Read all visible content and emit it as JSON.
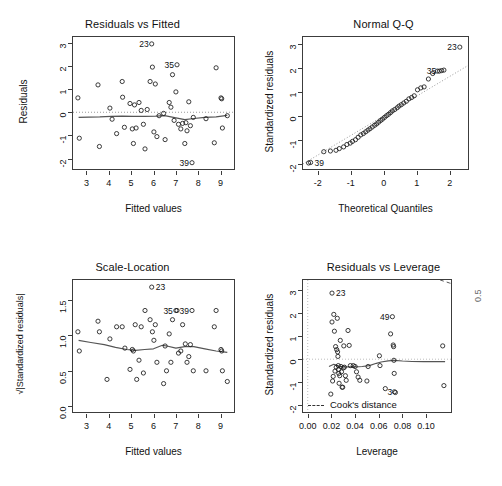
{
  "figure": {
    "kind": "r-regression-diagnostic-panel",
    "layout": "2x2",
    "background_color": "#ffffff",
    "foreground_color": "#1a1a1a",
    "point_symbol": "open-circle"
  },
  "chart_data": [
    {
      "id": "residuals-vs-fitted",
      "type": "scatter",
      "title": "Residuals vs Fitted",
      "xlabel": "Fitted values",
      "ylabel": "Residuals",
      "xlim": [
        2.4,
        9.6
      ],
      "ylim": [
        -2.45,
        3.25
      ],
      "xticks": [
        3,
        4,
        5,
        6,
        7,
        8,
        9
      ],
      "xticklabels": [
        "3",
        "4",
        "5",
        "6",
        "7",
        "8",
        "9"
      ],
      "yticks": [
        -2,
        -1,
        0,
        1,
        2,
        3
      ],
      "yticklabels": [
        "-2",
        "-1",
        "0",
        "1",
        "2",
        "3"
      ],
      "grid": false,
      "legend": "none",
      "reference_line": {
        "type": "horizontal-dotted",
        "y": 0,
        "color": "#9a9a9a"
      },
      "smooth_line": {
        "name": "lowess",
        "color": "#555555",
        "x": [
          2.65,
          3.1,
          3.6,
          4.1,
          4.6,
          5.1,
          5.6,
          6.1,
          6.5,
          7.0,
          7.4,
          7.8,
          8.3,
          8.8,
          9.3
        ],
        "y": [
          -0.22,
          -0.21,
          -0.2,
          -0.18,
          -0.17,
          -0.18,
          -0.18,
          -0.17,
          -0.15,
          -0.24,
          -0.32,
          -0.27,
          -0.22,
          -0.2,
          -0.13
        ]
      },
      "points": {
        "x": [
          2.62,
          2.68,
          3.52,
          3.58,
          4.05,
          4.15,
          4.35,
          4.6,
          4.62,
          4.7,
          4.95,
          5.05,
          5.1,
          5.15,
          5.22,
          5.35,
          5.45,
          5.55,
          5.62,
          5.72,
          5.85,
          5.92,
          5.95,
          6.02,
          6.08,
          6.15,
          6.25,
          6.45,
          6.52,
          6.7,
          6.78,
          6.85,
          6.92,
          7.0,
          7.05,
          7.12,
          7.22,
          7.3,
          7.4,
          7.45,
          7.5,
          7.58,
          7.65,
          7.72,
          7.78,
          8.35,
          8.72,
          8.8,
          9.02,
          9.05,
          9.08,
          9.3
        ],
        "y": [
          0.62,
          -1.12,
          1.18,
          -1.48,
          0.18,
          -0.3,
          -0.92,
          1.33,
          0.65,
          -0.65,
          0.38,
          -0.72,
          -1.35,
          0.32,
          -0.68,
          0.42,
          0.08,
          -0.52,
          -1.58,
          0.12,
          1.33,
          2.95,
          1.95,
          -0.85,
          1.22,
          -1.05,
          -0.15,
          -0.05,
          -1.18,
          0.42,
          0.22,
          1.62,
          -0.35,
          0.88,
          2.05,
          -0.52,
          -0.72,
          -0.48,
          -1.35,
          -0.45,
          -0.8,
          0.45,
          -0.58,
          -2.18,
          -0.22,
          -0.28,
          -1.32,
          1.92,
          0.62,
          0.58,
          -0.68,
          -0.15
        ]
      },
      "point_labels": [
        {
          "text": "23",
          "x": 5.92,
          "y": 2.95,
          "side": "left"
        },
        {
          "text": "35",
          "x": 7.05,
          "y": 2.05,
          "side": "left"
        },
        {
          "text": "39",
          "x": 7.72,
          "y": -2.18,
          "side": "left"
        }
      ]
    },
    {
      "id": "normal-qq",
      "type": "scatter",
      "title": "Normal Q-Q",
      "xlabel": "Theoretical Quantiles",
      "ylabel": "Standardized residuals",
      "xlim": [
        -2.45,
        2.55
      ],
      "ylim": [
        -2.2,
        3.3
      ],
      "xticks": [
        -2,
        -1,
        0,
        1,
        2
      ],
      "xticklabels": [
        "-2",
        "-1",
        "0",
        "1",
        "2"
      ],
      "yticks": [
        -2,
        -1,
        0,
        1,
        2,
        3
      ],
      "yticklabels": [
        "-2",
        "-1",
        "0",
        "1",
        "2",
        "3"
      ],
      "grid": false,
      "legend": "none",
      "reference_line": {
        "type": "qq-diagonal-dotted",
        "color": "#9a9a9a",
        "slope": 0.82,
        "intercept": 0.02
      },
      "points": {
        "x": [
          -2.28,
          -2.22,
          -1.82,
          -1.62,
          -1.45,
          -1.35,
          -1.22,
          -1.12,
          -1.02,
          -0.95,
          -0.86,
          -0.78,
          -0.7,
          -0.62,
          -0.55,
          -0.48,
          -0.42,
          -0.35,
          -0.28,
          -0.22,
          -0.16,
          -0.1,
          -0.04,
          0.02,
          0.08,
          0.14,
          0.2,
          0.26,
          0.33,
          0.4,
          0.46,
          0.53,
          0.6,
          0.68,
          0.76,
          0.84,
          0.92,
          1.02,
          1.12,
          1.22,
          1.35,
          1.48,
          1.62,
          1.68,
          1.75,
          1.82,
          2.3
        ],
        "y": [
          -1.95,
          -1.93,
          -1.48,
          -1.45,
          -1.42,
          -1.35,
          -1.28,
          -1.18,
          -1.12,
          -1.05,
          -0.98,
          -0.88,
          -0.78,
          -0.72,
          -0.65,
          -0.58,
          -0.52,
          -0.45,
          -0.38,
          -0.32,
          -0.25,
          -0.18,
          -0.12,
          -0.05,
          0.02,
          0.08,
          0.15,
          0.22,
          0.28,
          0.35,
          0.42,
          0.48,
          0.55,
          0.62,
          0.72,
          0.78,
          0.85,
          1.1,
          1.18,
          1.22,
          1.55,
          1.78,
          1.88,
          1.88,
          1.9,
          1.92,
          2.88
        ]
      },
      "point_labels": [
        {
          "text": "23",
          "x": 2.3,
          "y": 2.88,
          "side": "left"
        },
        {
          "text": "35",
          "x": 1.68,
          "y": 1.88,
          "side": "left"
        },
        {
          "text": "39",
          "x": -2.22,
          "y": -1.93,
          "side": "right"
        }
      ]
    },
    {
      "id": "scale-location",
      "type": "scatter",
      "title": "Scale-Location",
      "xlabel": "Fitted values",
      "ylabel": "√|Standardized residuals|",
      "xlim": [
        2.4,
        9.6
      ],
      "ylim": [
        -0.08,
        1.78
      ],
      "xticks": [
        3,
        4,
        5,
        6,
        7,
        8,
        9
      ],
      "xticklabels": [
        "3",
        "4",
        "5",
        "6",
        "7",
        "8",
        "9"
      ],
      "yticks": [
        0.0,
        0.5,
        1.0,
        1.5
      ],
      "yticklabels": [
        "0.0",
        "0.5",
        "1.0",
        "1.5"
      ],
      "grid": false,
      "legend": "none",
      "smooth_line": {
        "name": "lowess",
        "color": "#555555",
        "x": [
          2.65,
          3.2,
          3.8,
          4.3,
          4.8,
          5.2,
          5.6,
          6.0,
          6.4,
          6.6,
          7.0,
          7.4,
          7.8,
          8.3,
          8.8,
          9.3
        ],
        "y": [
          0.93,
          0.9,
          0.87,
          0.83,
          0.8,
          0.79,
          0.8,
          0.81,
          0.86,
          0.85,
          0.82,
          0.84,
          0.84,
          0.81,
          0.78,
          0.76
        ]
      },
      "points": {
        "x": [
          2.62,
          2.68,
          3.52,
          3.58,
          3.92,
          4.05,
          4.35,
          4.6,
          4.72,
          4.95,
          5.05,
          5.1,
          5.18,
          5.25,
          5.35,
          5.45,
          5.55,
          5.62,
          5.85,
          5.92,
          5.95,
          6.02,
          6.08,
          6.15,
          6.45,
          6.52,
          6.58,
          6.7,
          6.78,
          6.85,
          7.0,
          7.05,
          7.12,
          7.22,
          7.3,
          7.42,
          7.5,
          7.58,
          7.65,
          7.72,
          7.78,
          8.35,
          8.72,
          8.8,
          9.02,
          9.05,
          9.08,
          9.3
        ],
        "y": [
          1.05,
          0.78,
          1.2,
          1.05,
          0.38,
          0.95,
          1.12,
          1.12,
          0.82,
          0.52,
          0.8,
          0.78,
          1.15,
          0.38,
          0.65,
          1.12,
          0.47,
          1.35,
          1.22,
          1.68,
          1.05,
          0.93,
          1.15,
          0.62,
          0.32,
          0.85,
          0.5,
          1.02,
          0.62,
          1.22,
          1.35,
          1.35,
          0.75,
          0.78,
          1.15,
          0.88,
          0.62,
          0.7,
          0.87,
          1.35,
          0.5,
          0.5,
          1.12,
          1.35,
          0.8,
          0.78,
          0.5,
          0.35
        ]
      },
      "point_labels": [
        {
          "text": "23",
          "x": 5.92,
          "y": 1.68,
          "side": "right"
        },
        {
          "text": "35",
          "x": 7.0,
          "y": 1.35,
          "side": "left"
        },
        {
          "text": "39",
          "x": 7.72,
          "y": 1.35,
          "side": "left"
        }
      ]
    },
    {
      "id": "residuals-vs-leverage",
      "type": "scatter",
      "title": "Residuals vs Leverage",
      "xlabel": "Leverage",
      "ylabel": "Standardized residuals",
      "xlim": [
        -0.004,
        0.121
      ],
      "ylim": [
        -2.3,
        3.45
      ],
      "xticks": [
        0.0,
        0.02,
        0.04,
        0.06,
        0.08,
        0.1
      ],
      "xticklabels": [
        "0.00",
        "0.02",
        "0.04",
        "0.06",
        "0.08",
        "0.10"
      ],
      "yticks": [
        -2,
        -1,
        0,
        1,
        2,
        3
      ],
      "yticklabels": [
        "-2",
        "-1",
        "0",
        "1",
        "2",
        "3"
      ],
      "grid": false,
      "reference_lines": [
        {
          "type": "horizontal-dotted",
          "y": 0,
          "color": "#bdbdbd"
        },
        {
          "type": "vertical-dotted",
          "x": 0.0,
          "color": "#bdbdbd"
        }
      ],
      "cooks_contour": {
        "label": "0.5",
        "label_position": "right-edge",
        "style": "dashed",
        "color": "#555555"
      },
      "legend": {
        "position": "bottom-left",
        "entries": [
          {
            "label": "Cook's distance",
            "style": "dashed-line"
          }
        ]
      },
      "smooth_line": {
        "name": "lowess",
        "color": "#555555",
        "x": [
          0.018,
          0.022,
          0.026,
          0.03,
          0.034,
          0.04,
          0.046,
          0.052,
          0.058,
          0.062,
          0.068,
          0.073,
          0.08,
          0.088,
          0.098,
          0.11,
          0.116
        ],
        "y": [
          -0.32,
          -0.22,
          -0.3,
          -0.34,
          -0.33,
          -0.33,
          -0.32,
          -0.28,
          -0.18,
          -0.12,
          -0.07,
          -0.05,
          -0.08,
          -0.1,
          -0.11,
          -0.11,
          -0.11
        ]
      },
      "points": {
        "x": [
          0.0195,
          0.0205,
          0.0205,
          0.021,
          0.0215,
          0.022,
          0.0225,
          0.023,
          0.0235,
          0.024,
          0.0245,
          0.025,
          0.0252,
          0.0255,
          0.0258,
          0.026,
          0.0262,
          0.0265,
          0.027,
          0.0275,
          0.028,
          0.0285,
          0.029,
          0.0295,
          0.03,
          0.0305,
          0.031,
          0.0318,
          0.0325,
          0.034,
          0.035,
          0.036,
          0.0385,
          0.04,
          0.0412,
          0.0425,
          0.044,
          0.05,
          0.051,
          0.0605,
          0.061,
          0.0655,
          0.07,
          0.0715,
          0.0722,
          0.0725,
          0.0728,
          0.073,
          0.0732,
          0.074,
          0.114,
          0.115
        ],
        "y": [
          -1.52,
          2.88,
          1.62,
          -0.95,
          -0.75,
          1.95,
          1.22,
          -0.52,
          0.55,
          -0.35,
          0.42,
          1.78,
          0.32,
          0.12,
          -0.28,
          -0.45,
          -0.62,
          -1.05,
          -0.72,
          0.82,
          -0.32,
          -0.55,
          -1.22,
          -1.22,
          -0.38,
          0.58,
          -0.35,
          -0.72,
          -0.92,
          1.25,
          0.6,
          -0.28,
          -0.28,
          -0.32,
          -0.55,
          -0.78,
          -0.92,
          -0.95,
          -0.32,
          0.15,
          -0.28,
          -1.28,
          1.1,
          1.85,
          0.62,
          0.55,
          -0.05,
          -0.62,
          -1.42,
          -1.45,
          0.58,
          -1.15
        ]
      },
      "point_labels": [
        {
          "text": "23",
          "x": 0.0205,
          "y": 2.88,
          "side": "right"
        },
        {
          "text": "49",
          "x": 0.0715,
          "y": 1.85,
          "side": "left"
        },
        {
          "text": "3",
          "x": 0.074,
          "y": -1.45,
          "side": "left"
        }
      ]
    }
  ]
}
